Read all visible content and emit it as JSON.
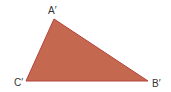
{
  "diagram": {
    "type": "triangle",
    "fill": "#c4694f",
    "stroke": "#b5423a",
    "vertices": {
      "A": {
        "label": "A′",
        "x": 54,
        "y": 19
      },
      "B": {
        "label": "B′",
        "x": 148,
        "y": 81
      },
      "C": {
        "label": "C′",
        "x": 26,
        "y": 81
      }
    }
  }
}
